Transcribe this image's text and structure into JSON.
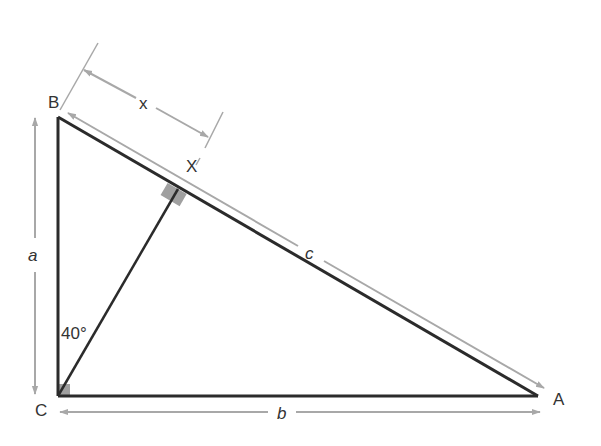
{
  "diagram": {
    "type": "right-triangle-with-altitude",
    "colors": {
      "edge": "#2b2b2b",
      "dimension": "#a8a8a8",
      "right_angle_marker": "#a0a0a0",
      "label": "#333333"
    },
    "vertices": {
      "A": "A",
      "B": "B",
      "C": "C",
      "X": "X"
    },
    "sides": {
      "a": "a",
      "b": "b",
      "c": "c",
      "x": "x"
    },
    "angle": {
      "label": "40°"
    }
  }
}
